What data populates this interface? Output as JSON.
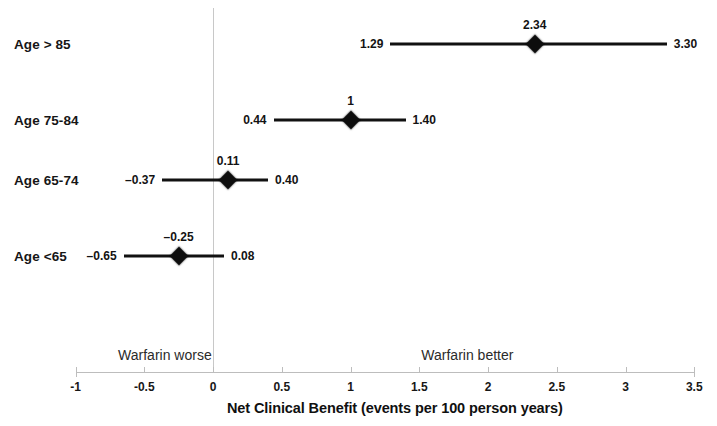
{
  "chart_data": {
    "type": "scatter",
    "subtype": "forest-plot",
    "title": "",
    "xlabel": "Net Clinical Benefit (events per 100 person years)",
    "ylabel": "",
    "xlim": [
      -1,
      3.5
    ],
    "xticks": [
      -1,
      -0.5,
      0,
      0.5,
      1,
      1.5,
      2,
      2.5,
      3,
      3.5
    ],
    "xticklabels": [
      "-1",
      "-0.5",
      "0",
      "0.5",
      "1",
      "1.5",
      "2",
      "2.5",
      "3",
      "3.5"
    ],
    "grid": false,
    "legend": false,
    "reference_line": 0,
    "categories": [
      "Age > 85",
      "Age 75-84",
      "Age 65-74",
      "Age <65"
    ],
    "series": [
      {
        "name": "Net clinical benefit",
        "points": [
          {
            "category": "Age > 85",
            "estimate": 2.34,
            "ci_low": 1.29,
            "ci_high": 3.3,
            "estimate_label": "2.34",
            "ci_low_label": "1.29",
            "ci_high_label": "3.30"
          },
          {
            "category": "Age 75-84",
            "estimate": 1.0,
            "ci_low": 0.44,
            "ci_high": 1.4,
            "estimate_label": "1",
            "ci_low_label": "0.44",
            "ci_high_label": "1.40"
          },
          {
            "category": "Age 65-74",
            "estimate": 0.11,
            "ci_low": -0.37,
            "ci_high": 0.4,
            "estimate_label": "0.11",
            "ci_low_label": "–0.37",
            "ci_high_label": "0.40"
          },
          {
            "category": "Age <65",
            "estimate": -0.25,
            "ci_low": -0.65,
            "ci_high": 0.08,
            "estimate_label": "–0.25",
            "ci_low_label": "–0.65",
            "ci_high_label": "0.08"
          }
        ]
      }
    ],
    "annotations": [
      {
        "text": "Warfarin worse",
        "x": -0.35,
        "side": "left"
      },
      {
        "text": "Warfarin better",
        "x": 1.85,
        "side": "right"
      }
    ],
    "colors": {
      "marker": "#0d0d0d",
      "line": "#111111",
      "axis": "#bdbdbd",
      "reference_line": "#c8c8c8",
      "text": "#161616",
      "background": "#ffffff"
    }
  },
  "axis_title": "Net Clinical Benefit (events per 100 person years)",
  "notes": {
    "worse": "Warfarin worse",
    "better": "Warfarin better"
  }
}
